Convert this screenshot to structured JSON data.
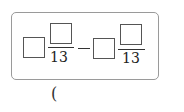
{
  "expression": {
    "term1": {
      "whole": "",
      "numerator": "",
      "denominator": "13"
    },
    "operator": "−",
    "term2": {
      "whole": "",
      "numerator": "",
      "denominator": "13"
    }
  },
  "answer": {
    "open_paren": "("
  }
}
